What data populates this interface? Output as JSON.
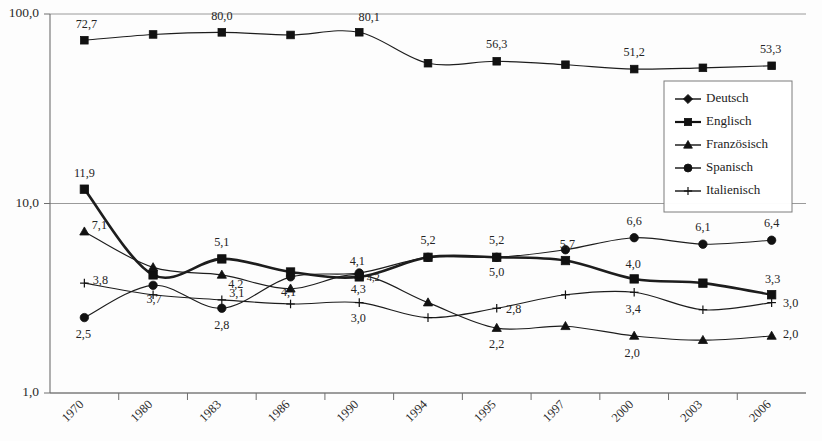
{
  "chart_data": {
    "type": "line",
    "title": "",
    "subtitle": "",
    "xlabel": "",
    "ylabel": "",
    "yscale": "log",
    "ylim": [
      1.0,
      100.0
    ],
    "grid": true,
    "y_ticks": [
      1.0,
      10.0,
      100.0
    ],
    "y_tick_labels": [
      "1,0",
      "10,0",
      "100,0"
    ],
    "legend_position": "right-upper",
    "categories": [
      "1970",
      "1980",
      "1983",
      "1986",
      "1990",
      "1994",
      "1995",
      "1997",
      "2000",
      "2003",
      "2006"
    ],
    "series": [
      {
        "name": "Deutsch",
        "marker": "diamond",
        "line": "thin",
        "values": [
          null,
          null,
          null,
          null,
          null,
          null,
          null,
          null,
          null,
          null,
          null
        ],
        "labels": []
      },
      {
        "name": "Englisch",
        "marker": "square",
        "line": "thick",
        "values": [
          11.9,
          4.2,
          5.1,
          4.35,
          4.1,
          5.2,
          5.2,
          5.0,
          4.0,
          3.8,
          3.3
        ],
        "labels": [
          {
            "i": 0,
            "text": "11,9",
            "dx": 0,
            "dy": -12
          },
          {
            "i": 2,
            "text": "5,1",
            "dx": 0,
            "dy": -13
          },
          {
            "i": 4,
            "text": "4,1",
            "dx": -2,
            "dy": -12
          },
          {
            "i": 5,
            "text": "5,2",
            "dx": 0,
            "dy": -13
          },
          {
            "i": 6,
            "text": "5,2",
            "dx": 0,
            "dy": -13
          },
          {
            "i": 7,
            "text": "5,7",
            "dx": 2,
            "dy": -13
          },
          {
            "i": 8,
            "text": "4,0",
            "dx": -1,
            "dy": -11
          },
          {
            "i": 10,
            "text": "3,3",
            "dx": 1,
            "dy": -12
          }
        ]
      },
      {
        "name": "Franzoesisch",
        "marker": "triangle",
        "line": "thin",
        "values": [
          7.1,
          4.6,
          4.2,
          3.55,
          4.2,
          3.0,
          2.2,
          2.25,
          2.0,
          1.9,
          2.0
        ],
        "labels": [
          {
            "i": 0,
            "text": "7,1",
            "dx": 15,
            "dy": -3
          },
          {
            "i": 2,
            "text": "4,2",
            "dx": 14,
            "dy": 13
          },
          {
            "i": 4,
            "text": "4,2",
            "dx": 14,
            "dy": 6,
            "tiny": true
          },
          {
            "i": 6,
            "text": "2,2",
            "dx": 0,
            "dy": 20
          },
          {
            "i": 8,
            "text": "2,0",
            "dx": -2,
            "dy": 21
          },
          {
            "i": 10,
            "text": "2,0",
            "dx": 19,
            "dy": 2
          }
        ]
      },
      {
        "name": "Spanisch",
        "marker": "circle",
        "line": "thin",
        "values": [
          2.5,
          3.7,
          2.8,
          4.1,
          4.3,
          5.2,
          5.2,
          5.7,
          6.6,
          6.1,
          6.4
        ],
        "labels": [
          {
            "i": 0,
            "text": "2,5",
            "dx": -1,
            "dy": 20
          },
          {
            "i": 1,
            "text": "3,7",
            "dx": 1,
            "dy": 18
          },
          {
            "i": 2,
            "text": "2,8",
            "dx": 0,
            "dy": 21
          },
          {
            "i": 3,
            "text": "4,1",
            "dx": -2,
            "dy": 19
          },
          {
            "i": 4,
            "text": "4,3",
            "dx": -1,
            "dy": 20
          },
          {
            "i": 6,
            "text": "5,0",
            "dx": 0,
            "dy": 19
          },
          {
            "i": 8,
            "text": "6,6",
            "dx": 0,
            "dy": -13
          },
          {
            "i": 9,
            "text": "6,1",
            "dx": 0,
            "dy": -13
          },
          {
            "i": 10,
            "text": "6,4",
            "dx": 0,
            "dy": -13
          }
        ]
      },
      {
        "name": "Italienisch",
        "marker": "plus",
        "line": "thin",
        "values": [
          3.8,
          3.3,
          3.1,
          2.95,
          3.0,
          2.5,
          2.8,
          3.3,
          3.4,
          2.75,
          3.0
        ],
        "labels": [
          {
            "i": 0,
            "text": "3,8",
            "dx": 16,
            "dy": 1
          },
          {
            "i": 2,
            "text": "3,1",
            "dx": 15,
            "dy": -3
          },
          {
            "i": 4,
            "text": "3,0",
            "dx": -1,
            "dy": 19
          },
          {
            "i": 6,
            "text": "2,8",
            "dx": 17,
            "dy": 5
          },
          {
            "i": 8,
            "text": "3,4",
            "dx": -1,
            "dy": 21
          },
          {
            "i": 10,
            "text": "3,0",
            "dx": 19,
            "dy": 4
          }
        ]
      },
      {
        "name": "Englisch-Top",
        "marker": "square",
        "line": "thin",
        "values": [
          72.7,
          78.0,
          80.0,
          77.5,
          80.1,
          55.0,
          56.3,
          54.0,
          51.2,
          52.0,
          53.3
        ],
        "labels": [
          {
            "i": 0,
            "text": "72,7",
            "dx": 2,
            "dy": -12
          },
          {
            "i": 2,
            "text": "80,0",
            "dx": 0,
            "dy": -12
          },
          {
            "i": 4,
            "text": "80,1",
            "dx": 10,
            "dy": -11
          },
          {
            "i": 6,
            "text": "56,3",
            "dx": 0,
            "dy": -13
          },
          {
            "i": 8,
            "text": "51,2",
            "dx": 0,
            "dy": -13
          },
          {
            "i": 10,
            "text": "53,3",
            "dx": -1,
            "dy": -13
          }
        ]
      }
    ],
    "legend_entries": [
      {
        "label": "Deutsch",
        "marker": "diamond",
        "line": "thin"
      },
      {
        "label": "Englisch",
        "marker": "square",
        "line": "thick"
      },
      {
        "label": "Französisch",
        "marker": "triangle",
        "line": "thin"
      },
      {
        "label": "Spanisch",
        "marker": "circle",
        "line": "thin"
      },
      {
        "label": "Italienisch",
        "marker": "plus",
        "line": "thin"
      }
    ],
    "colors": {
      "series": "#111111",
      "grid": "#9a9a9a",
      "axis": "#6e6e6e",
      "background": "#fdfdfd",
      "text": "#242424"
    }
  }
}
